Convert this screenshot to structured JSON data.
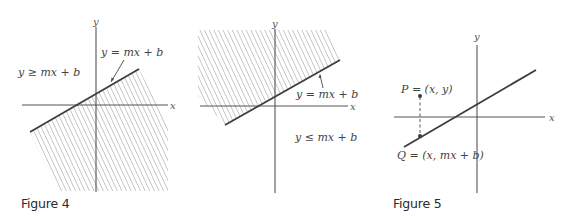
{
  "figures": [
    {
      "id": "fig4-left",
      "caption": "",
      "axes": {
        "x_label": "x",
        "y_label": "y"
      },
      "labels": {
        "line": "y = mx + b",
        "region": "y ≥ mx + b"
      },
      "shaded_region": "below line (y ≤ mx + b side is hatched)"
    },
    {
      "id": "fig4-right",
      "caption": "",
      "axes": {
        "x_label": "x",
        "y_label": "y"
      },
      "labels": {
        "line": "y = mx + b",
        "region": "y ≤ mx + b"
      },
      "shaded_region": "above line (y ≥ mx + b side is hatched)"
    },
    {
      "id": "fig5",
      "caption": "",
      "axes": {
        "x_label": "x",
        "y_label": "y"
      },
      "labels": {
        "P": "P = (x, y)",
        "Q": "Q = (x, mx + b)"
      }
    }
  ],
  "captions": {
    "figure4": "Figure 4",
    "figure5": "Figure 5"
  },
  "colors": {
    "background": "#ffffff",
    "axis": "#555555",
    "line": "#3d3d3d",
    "hatch": "#8a8a8a",
    "text": "#444444"
  }
}
